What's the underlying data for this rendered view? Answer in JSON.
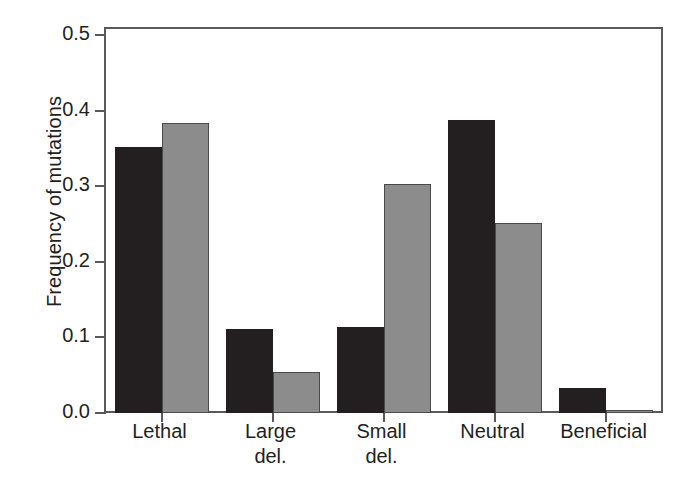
{
  "chart_data": {
    "type": "bar",
    "title": "",
    "xlabel": "",
    "ylabel": "Frequency of mutations",
    "categories": [
      "Lethal",
      "Large del.",
      "Small del.",
      "Neutral",
      "Beneficial"
    ],
    "category_lines": [
      [
        "Lethal"
      ],
      [
        "Large",
        "del."
      ],
      [
        "Small",
        "del."
      ],
      [
        "Neutral"
      ],
      [
        "Beneficial"
      ]
    ],
    "series": [
      {
        "name": "dark",
        "color": "#231f20",
        "values": [
          0.352,
          0.111,
          0.114,
          0.387,
          0.033
        ]
      },
      {
        "name": "light",
        "color": "#8c8c8c",
        "values": [
          0.384,
          0.054,
          0.303,
          0.251,
          0.004
        ]
      }
    ],
    "ylim": [
      0.0,
      0.5
    ],
    "yticks": [
      0.0,
      0.1,
      0.2,
      0.3,
      0.4,
      0.5
    ],
    "ytick_labels": [
      "0.0",
      "0.1",
      "0.2",
      "0.3",
      "0.4",
      "0.5"
    ],
    "grid": false,
    "legend": "none",
    "frame_color": "#58595b",
    "background": "#ffffff"
  }
}
